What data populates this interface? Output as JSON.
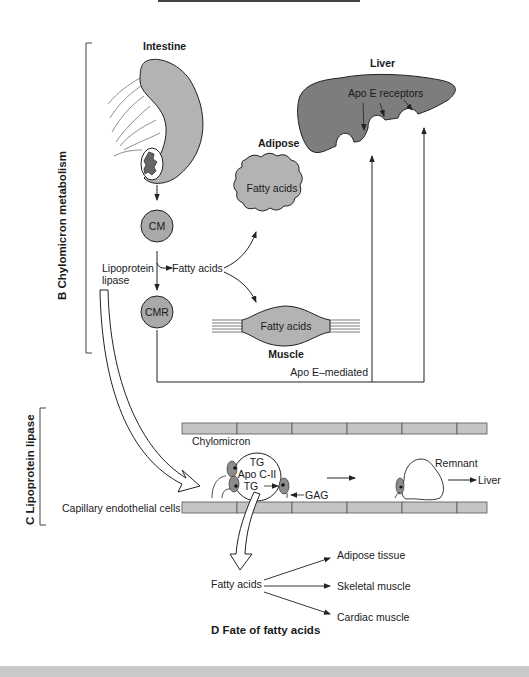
{
  "colors": {
    "organ_fill": "#b3b3b3",
    "liver_fill": "#7d7d7d",
    "particle_fill": "#a9a9a9",
    "cell_fill": "#c4c4c4",
    "enzyme_fill": "#8c8c8c",
    "stroke": "#222222",
    "footer_band": "#c9c9c9"
  },
  "section_b": {
    "title": "B  Chylomicron metabolism",
    "intestine_label": "Intestine",
    "liver_label": "Liver",
    "apo_e_receptors_label": "Apo E receptors",
    "adipose_label": "Adipose",
    "adipose_content": "Fatty acids",
    "cm_label": "CM",
    "cmr_label": "CMR",
    "lipoprotein_lipase_line1": "Lipoprotein",
    "lipoprotein_lipase_line2": "lipase",
    "fatty_acids_label": "Fatty acids",
    "muscle_content": "Fatty acids",
    "muscle_label": "Muscle",
    "apo_e_mediated_label": "Apo E–mediated"
  },
  "section_c": {
    "title": "C  Lipoprotein lipase",
    "chylomicron_label": "Chylomicron",
    "tg_top": "TG",
    "apo_c2": "Apo C-II",
    "tg_bottom": "TG",
    "gag_label": "GAG",
    "remnant_label": "Remnant",
    "liver_label": "Liver",
    "capillary_label": "Capillary endothelial cells"
  },
  "section_d": {
    "title": "D  Fate of fatty acids",
    "source_label": "Fatty acids",
    "targets": [
      "Adipose tissue",
      "Skeletal muscle",
      "Cardiac muscle"
    ]
  }
}
